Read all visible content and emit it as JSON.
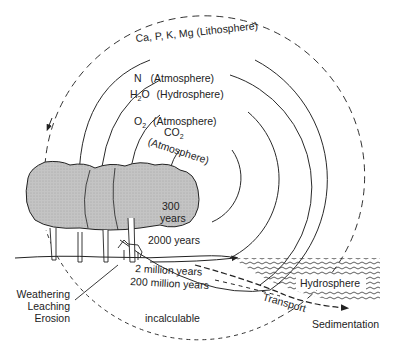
{
  "cycles": [
    {
      "element": "Ca, P, K, Mg",
      "reservoir": "(Lithosphere)",
      "timescale": "incalculable",
      "style": "dashed"
    },
    {
      "element": "N",
      "reservoir": "(Atmosphere)",
      "timescale": "200 million years",
      "style": "solid"
    },
    {
      "element": "H",
      "element_sub": "2",
      "element_tail": "O",
      "reservoir": "(Hydrosphere)",
      "timescale": "2 million years",
      "style": "solid"
    },
    {
      "element": "O",
      "element_sub": "2",
      "reservoir": "(Atmosphere)",
      "timescale": "2000 years",
      "style": "solid"
    },
    {
      "element": "CO",
      "element_sub": "2",
      "reservoir": "(Atmosphere)",
      "timescale_line1": "300",
      "timescale_line2": "years",
      "style": "solid"
    }
  ],
  "labels": {
    "weathering": "Weathering",
    "leaching": "Leaching",
    "erosion": "Erosion",
    "hydrosphere": "Hydrosphere",
    "transport": "Transport",
    "sedimentation": "Sedimentation"
  },
  "colors": {
    "line": "#2a2a2a",
    "tree_fill": "#bdbdbd",
    "background": "#ffffff"
  }
}
